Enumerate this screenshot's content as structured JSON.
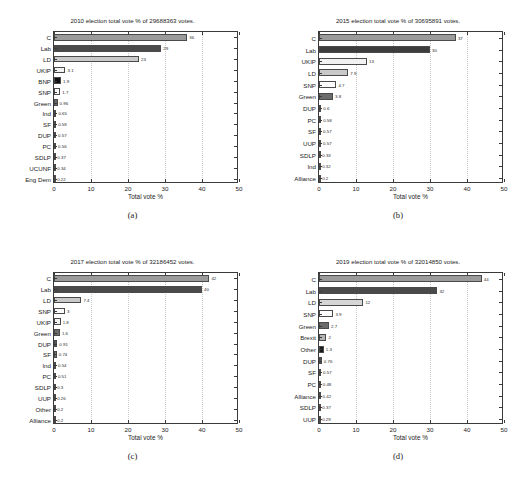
{
  "figure": {
    "xlabel": "Total vote %",
    "xticks": [
      0,
      10,
      20,
      30,
      40,
      50
    ],
    "xlim": [
      0,
      50
    ]
  },
  "panels": [
    {
      "letter": "(a)",
      "title": "2010 election total vote % of 29688363 votes.",
      "chart_data": {
        "type": "bar",
        "orientation": "horizontal",
        "title": "2010 election total vote % of 29688363 votes.",
        "xlabel": "Total vote %",
        "ylabel": "",
        "xlim": [
          0,
          50
        ],
        "xticks": [
          0,
          10,
          20,
          30,
          40,
          50
        ],
        "grid": true,
        "categories": [
          "Eng Dem",
          "UCUNF",
          "SDLP",
          "PC",
          "DUP",
          "SF",
          "Ind",
          "Green",
          "SNP",
          "BNP",
          "UKIP",
          "LD",
          "Lab",
          "C"
        ],
        "values": [
          0.22,
          0.34,
          0.37,
          0.56,
          0.57,
          0.58,
          0.65,
          0.96,
          1.7,
          1.9,
          3.1,
          23,
          29,
          36
        ],
        "labels": [
          "0.22",
          "0.34",
          "0.37",
          "0.56",
          "0.57",
          "0.58",
          "0.65",
          "0.96",
          "1.7",
          "1.9",
          "3.1",
          "23",
          "29",
          "36"
        ],
        "colors": [
          "#595959",
          "#1f1f1f",
          "#6e6e6e",
          "#737373",
          "#6a6a6a",
          "#7d7d7d",
          "#1a1a1a",
          "#6b6b6b",
          "#fdfdfd",
          "#111111",
          "#f2f2f2",
          "#c9c9c9",
          "#4a4a4a",
          "#9b9b9b"
        ]
      }
    },
    {
      "letter": "(b)",
      "title": "2015 election total vote % of 30695891 votes.",
      "chart_data": {
        "type": "bar",
        "orientation": "horizontal",
        "title": "2015 election total vote % of 30695891 votes.",
        "xlabel": "Total vote %",
        "ylabel": "",
        "xlim": [
          0,
          50
        ],
        "xticks": [
          0,
          10,
          20,
          30,
          40,
          50
        ],
        "grid": true,
        "categories": [
          "Alliance",
          "Ind",
          "SDLP",
          "UUP",
          "SF",
          "PC",
          "DUP",
          "Green",
          "SNP",
          "LD",
          "UKIP",
          "Lab",
          "C"
        ],
        "values": [
          0.2,
          0.32,
          0.33,
          0.57,
          0.57,
          0.58,
          0.6,
          3.8,
          4.7,
          7.9,
          13,
          30,
          37
        ],
        "labels": [
          "0.2",
          "0.32",
          "0.33",
          "0.57",
          "0.57",
          "0.58",
          "0.6",
          "3.8",
          "4.7",
          "7.9",
          "13",
          "30",
          "37"
        ],
        "colors": [
          "#5e5e5e",
          "#1f1f1f",
          "#6e6e6e",
          "#737373",
          "#777777",
          "#6a6a6a",
          "#4d4d4d",
          "#6b6b6b",
          "#fdfdfd",
          "#c9c9c9",
          "#f2f2f2",
          "#3d3d3d",
          "#9b9b9b"
        ]
      }
    },
    {
      "letter": "(c)",
      "title": "2017 election total vote % of 32186452 votes.",
      "chart_data": {
        "type": "bar",
        "orientation": "horizontal",
        "title": "2017 election total vote % of 32186452 votes.",
        "xlabel": "Total vote %",
        "ylabel": "",
        "xlim": [
          0,
          50
        ],
        "xticks": [
          0,
          10,
          20,
          30,
          40,
          50
        ],
        "grid": true,
        "categories": [
          "Alliance",
          "Other",
          "UUP",
          "SDLP",
          "PC",
          "Ind",
          "SF",
          "DUP",
          "Green",
          "UKIP",
          "SNP",
          "LD",
          "Lab",
          "C"
        ],
        "values": [
          0.2,
          0.2,
          0.26,
          0.3,
          0.51,
          0.54,
          0.74,
          0.91,
          1.6,
          1.8,
          3,
          7.4,
          40,
          42
        ],
        "labels": [
          "0.2",
          "0.2",
          "0.26",
          "0.3",
          "0.51",
          "0.54",
          "0.74",
          "0.91",
          "1.6",
          "1.8",
          "3",
          "7.4",
          "40",
          "42"
        ],
        "colors": [
          "#5e5e5e",
          "#3a3a3a",
          "#6e6e6e",
          "#737373",
          "#5a5a5a",
          "#1a1a1a",
          "#777777",
          "#555555",
          "#6b6b6b",
          "#f2f2f2",
          "#fdfdfd",
          "#c9c9c9",
          "#4a4a4a",
          "#9b9b9b"
        ]
      }
    },
    {
      "letter": "(d)",
      "title": "2019 election total vote % of 32014850 votes.",
      "chart_data": {
        "type": "bar",
        "orientation": "horizontal",
        "title": "2019 election total vote % of 32014850 votes.",
        "xlabel": "Total vote %",
        "ylabel": "",
        "xlim": [
          0,
          50
        ],
        "xticks": [
          0,
          10,
          20,
          30,
          40,
          50
        ],
        "grid": true,
        "categories": [
          "UUP",
          "SDLP",
          "Alliance",
          "PC",
          "SF",
          "DUP",
          "Other",
          "Brexit",
          "Green",
          "SNP",
          "LD",
          "Lab",
          "C"
        ],
        "values": [
          0.29,
          0.37,
          0.42,
          0.48,
          0.57,
          0.76,
          1.3,
          2,
          2.7,
          3.9,
          12,
          32,
          44
        ],
        "labels": [
          "0.29",
          "0.37",
          "0.42",
          "0.48",
          "0.57",
          "0.76",
          "1.3",
          "2",
          "2.7",
          "3.9",
          "12",
          "32",
          "44"
        ],
        "colors": [
          "#5e5e5e",
          "#6e6e6e",
          "#737373",
          "#6a6a6a",
          "#777777",
          "#555555",
          "#1a1a1a",
          "#b4b4b4",
          "#6b6b6b",
          "#fdfdfd",
          "#d6d6d6",
          "#4a4a4a",
          "#9b9b9b"
        ]
      }
    }
  ]
}
